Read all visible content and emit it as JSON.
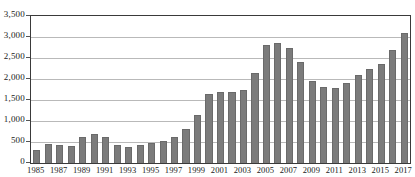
{
  "chart_data": {
    "type": "bar",
    "title": "",
    "subtitle": "",
    "xlabel": "",
    "ylabel": "",
    "ylim": [
      0,
      3500
    ],
    "ytick_values": [
      0,
      500,
      1000,
      1500,
      2000,
      2500,
      3000,
      3500
    ],
    "ytick_labels": [
      "0",
      "500",
      "1,000",
      "1,500",
      "2,000",
      "2,500",
      "3,000",
      "3,500"
    ],
    "grid": true,
    "legend": null,
    "bar_color": "#7b7b7b",
    "categories": [
      "1985",
      "1986",
      "1987",
      "1988",
      "1989",
      "1990",
      "1991",
      "1992",
      "1993",
      "1994",
      "1995",
      "1996",
      "1997",
      "1998",
      "1999",
      "2000",
      "2001",
      "2002",
      "2003",
      "2004",
      "2005",
      "2006",
      "2007",
      "2008",
      "2009",
      "2010",
      "2011",
      "2012",
      "2013",
      "2014",
      "2015",
      "2016",
      "2017"
    ],
    "values": [
      300,
      450,
      440,
      400,
      620,
      700,
      620,
      420,
      380,
      420,
      480,
      520,
      620,
      800,
      1150,
      1650,
      1700,
      1700,
      1750,
      2150,
      2800,
      2850,
      2750,
      2400,
      1950,
      1800,
      1780,
      1900,
      2100,
      2250,
      2350,
      2700,
      3100
    ],
    "xtick_labels": [
      "1985",
      "1987",
      "1989",
      "1991",
      "1993",
      "1995",
      "1997",
      "1999",
      "2001",
      "2003",
      "2005",
      "2007",
      "2009",
      "2011",
      "2013",
      "2015",
      "2017"
    ],
    "xtick_indices": [
      0,
      2,
      4,
      6,
      8,
      10,
      12,
      14,
      16,
      18,
      20,
      22,
      24,
      26,
      28,
      30,
      32
    ]
  }
}
